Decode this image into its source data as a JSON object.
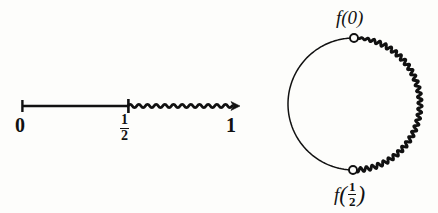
{
  "figure": {
    "background_color": "#fdfdfb",
    "ink_color": "#111111"
  },
  "interval": {
    "label_left": "0",
    "label_mid_numerator": "1",
    "label_mid_denominator": "2",
    "label_right": "1",
    "smooth_segment": {
      "from_label": "0",
      "to_label": "1/2",
      "style": "straight"
    },
    "wavy_segment": {
      "from_label": "1/2",
      "to_label": "1",
      "style": "wavy",
      "oscillation_count": 12,
      "arrowhead": true
    },
    "geometry": {
      "axis_y": 106,
      "x_zero": 22,
      "x_half": 128,
      "x_one": 238,
      "tick_height": 11
    }
  },
  "circle": {
    "center_x": 354,
    "center_y": 104,
    "radius": 66,
    "smooth_arc": {
      "side": "left",
      "style": "thin-smooth"
    },
    "wavy_arc": {
      "side": "right",
      "style": "thick-wavy",
      "oscillation_count": 34,
      "amplitude": 2.2
    },
    "markers": [
      {
        "name": "f-of-zero",
        "label_text": "f(0)",
        "position": "top",
        "x": 354,
        "y": 38,
        "style": "open-circle"
      },
      {
        "name": "f-of-one-half",
        "label_text": "f(1/2)",
        "label_function": "f",
        "label_numerator": "1",
        "label_denominator": "2",
        "position": "bottom",
        "x": 353,
        "y": 170,
        "style": "open-circle"
      }
    ]
  }
}
